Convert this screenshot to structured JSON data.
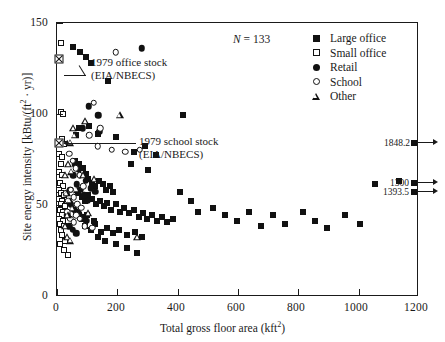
{
  "chart_data": {
    "type": "scatter",
    "title": "",
    "xlabel": "Total gross floor area (kft2)",
    "ylabel": "Site energy intensity [kBtu/(ft2 · yr)]",
    "xlim": [
      0,
      1200
    ],
    "ylim": [
      0,
      150
    ],
    "xticks": [
      0,
      200,
      400,
      600,
      800,
      1000,
      1200
    ],
    "yticks": [
      0,
      50,
      100,
      150
    ],
    "grid": false,
    "legend_position": "top-right",
    "sample_size_label": "N = 133",
    "sample_size": 133,
    "series": [
      {
        "name": "Large office",
        "marker": "filled-square",
        "points": [
          [
            52,
            137
          ],
          [
            78,
            134
          ],
          [
            96,
            131
          ],
          [
            112,
            128
          ],
          [
            420,
            99
          ],
          [
            170,
            118
          ],
          [
            72,
            92
          ],
          [
            108,
            93
          ],
          [
            136,
            89
          ],
          [
            196,
            87
          ],
          [
            62,
            88
          ],
          [
            258,
            79
          ],
          [
            292,
            82
          ],
          [
            330,
            77
          ],
          [
            248,
            72
          ],
          [
            302,
            69
          ],
          [
            60,
            74
          ],
          [
            74,
            72
          ],
          [
            86,
            70
          ],
          [
            96,
            67
          ],
          [
            104,
            64
          ],
          [
            116,
            62
          ],
          [
            126,
            60
          ],
          [
            140,
            63
          ],
          [
            152,
            61
          ],
          [
            164,
            58
          ],
          [
            176,
            60
          ],
          [
            188,
            57
          ],
          [
            70,
            56
          ],
          [
            82,
            54
          ],
          [
            92,
            52
          ],
          [
            104,
            55
          ],
          [
            118,
            53
          ],
          [
            130,
            50
          ],
          [
            142,
            52
          ],
          [
            156,
            49
          ],
          [
            168,
            51
          ],
          [
            180,
            47
          ],
          [
            196,
            50
          ],
          [
            210,
            46
          ],
          [
            224,
            48
          ],
          [
            240,
            45
          ],
          [
            256,
            47
          ],
          [
            272,
            43
          ],
          [
            286,
            45
          ],
          [
            300,
            42
          ],
          [
            318,
            44
          ],
          [
            334,
            41
          ],
          [
            350,
            43
          ],
          [
            368,
            40
          ],
          [
            386,
            42
          ],
          [
            94,
            38
          ],
          [
            112,
            36
          ],
          [
            128,
            39
          ],
          [
            148,
            35
          ],
          [
            166,
            37
          ],
          [
            186,
            34
          ],
          [
            208,
            36
          ],
          [
            232,
            33
          ],
          [
            260,
            35
          ],
          [
            284,
            32
          ],
          [
            64,
            46
          ],
          [
            74,
            44
          ],
          [
            84,
            42
          ],
          [
            100,
            44
          ],
          [
            122,
            41
          ],
          [
            410,
            57
          ],
          [
            448,
            52
          ],
          [
            470,
            46
          ],
          [
            520,
            48
          ],
          [
            560,
            44
          ],
          [
            600,
            41
          ],
          [
            640,
            46
          ],
          [
            680,
            38
          ],
          [
            720,
            44
          ],
          [
            760,
            39
          ],
          [
            820,
            46
          ],
          [
            860,
            41
          ],
          [
            900,
            37
          ],
          [
            960,
            44
          ],
          [
            1010,
            39
          ],
          [
            1060,
            61
          ],
          [
            1140,
            63
          ],
          [
            232,
            26
          ],
          [
            268,
            23
          ],
          [
            196,
            28
          ],
          [
            160,
            30
          ],
          [
            136,
            32
          ]
        ]
      },
      {
        "name": "Small office",
        "marker": "open-square",
        "points": [
          [
            14,
            139
          ],
          [
            12,
            101
          ],
          [
            20,
            100
          ],
          [
            16,
            86
          ],
          [
            10,
            84
          ],
          [
            22,
            83
          ],
          [
            8,
            78
          ],
          [
            18,
            76
          ],
          [
            12,
            72
          ],
          [
            6,
            68
          ],
          [
            16,
            66
          ],
          [
            10,
            62
          ],
          [
            20,
            60
          ],
          [
            8,
            58
          ],
          [
            14,
            56
          ],
          [
            24,
            55
          ],
          [
            6,
            53
          ],
          [
            18,
            52
          ],
          [
            12,
            50
          ],
          [
            26,
            49
          ],
          [
            9,
            47
          ],
          [
            21,
            46
          ],
          [
            15,
            44
          ],
          [
            7,
            42
          ],
          [
            19,
            41
          ],
          [
            11,
            39
          ],
          [
            23,
            38
          ],
          [
            13,
            36
          ],
          [
            17,
            33
          ],
          [
            28,
            30
          ],
          [
            10,
            28
          ],
          [
            22,
            25
          ],
          [
            36,
            22
          ]
        ]
      },
      {
        "name": "Retail",
        "marker": "filled-circle",
        "points": [
          [
            282,
            136
          ],
          [
            106,
            104
          ],
          [
            138,
            99
          ],
          [
            86,
            92
          ],
          [
            140,
            90
          ],
          [
            60,
            72
          ],
          [
            72,
            69
          ],
          [
            96,
            63
          ],
          [
            112,
            59
          ],
          [
            128,
            57
          ],
          [
            54,
            66
          ],
          [
            66,
            61
          ],
          [
            78,
            58
          ],
          [
            90,
            55
          ],
          [
            102,
            52
          ],
          [
            46,
            50
          ],
          [
            58,
            47
          ],
          [
            70,
            45
          ],
          [
            84,
            43
          ],
          [
            98,
            41
          ],
          [
            40,
            38
          ],
          [
            52,
            36
          ],
          [
            64,
            34
          ],
          [
            44,
            58
          ],
          [
            34,
            44
          ]
        ]
      },
      {
        "name": "School",
        "marker": "open-circle",
        "points": [
          [
            196,
            134
          ],
          [
            122,
            106
          ],
          [
            144,
            92
          ],
          [
            108,
            88
          ],
          [
            40,
            78
          ],
          [
            52,
            74
          ],
          [
            62,
            70
          ],
          [
            76,
            66
          ],
          [
            88,
            60
          ],
          [
            136,
            82
          ],
          [
            182,
            80
          ],
          [
            228,
            79
          ],
          [
            276,
            80
          ],
          [
            46,
            58
          ],
          [
            56,
            54
          ],
          [
            68,
            50
          ],
          [
            80,
            48
          ],
          [
            34,
            46
          ],
          [
            44,
            42
          ],
          [
            56,
            40
          ],
          [
            92,
            38
          ],
          [
            118,
            37
          ],
          [
            30,
            56
          ],
          [
            38,
            52
          ],
          [
            64,
            44
          ],
          [
            76,
            42
          ]
        ]
      },
      {
        "name": "Other",
        "marker": "open-triangle",
        "points": [
          [
            94,
            96
          ],
          [
            210,
            99
          ],
          [
            54,
            92
          ],
          [
            60,
            88
          ],
          [
            44,
            84
          ],
          [
            38,
            72
          ],
          [
            48,
            68
          ],
          [
            88,
            66
          ],
          [
            124,
            64
          ],
          [
            32,
            56
          ],
          [
            42,
            52
          ],
          [
            52,
            48
          ],
          [
            36,
            44
          ],
          [
            28,
            38
          ],
          [
            34,
            32
          ],
          [
            44,
            30
          ],
          [
            268,
            32
          ],
          [
            28,
            66
          ],
          [
            66,
            58
          ],
          [
            104,
            45
          ]
        ]
      }
    ],
    "annotations": [
      {
        "id": "office-stock",
        "lines": [
          "1979 office stock",
          "(EIA/NBECS)"
        ],
        "marker": "crossed-square",
        "x": 8,
        "y": 130
      },
      {
        "id": "school-stock",
        "lines": [
          "1979 school stock",
          "(EIA/NBECS)"
        ],
        "marker": "crossed-square",
        "x": 6,
        "y": 84
      }
    ],
    "offscale_points": [
      {
        "id": "offscale-upper",
        "labels": [
          "1848.2"
        ],
        "x": 1200,
        "y_display": 66,
        "values": [
          1848.2
        ]
      },
      {
        "id": "offscale-lower",
        "labels": [
          "1300",
          "1393.5"
        ],
        "x": 1200,
        "y_display": 42,
        "values": [
          1300,
          1393.5
        ]
      }
    ]
  },
  "axes": {
    "x_title_main": "Total gross floor area (kft",
    "x_title_sup": "2",
    "x_title_end": ")",
    "y_title_a": "Site energy intensity [kBtu/(ft",
    "y_title_sup": "2",
    "y_title_b": " · yr)]",
    "xticks": [
      "0",
      "200",
      "400",
      "600",
      "800",
      "1000",
      "1200"
    ],
    "yticks": [
      "0",
      "50",
      "100",
      "150"
    ]
  },
  "n_label": {
    "prefix": "N",
    "equals": " = ",
    "value": "133"
  },
  "legend": {
    "items": [
      {
        "label": "Large office",
        "marker": "filled-square"
      },
      {
        "label": "Small office",
        "marker": "open-square"
      },
      {
        "label": "Retail",
        "marker": "filled-circle"
      },
      {
        "label": "School",
        "marker": "open-circle"
      },
      {
        "label": "Other",
        "marker": "open-triangle"
      }
    ]
  },
  "annotations": {
    "office": {
      "line1": "1979 office stock",
      "line2": "(EIA/NBECS)"
    },
    "school": {
      "line1": "1979 school stock",
      "line2": "(EIA/NBECS)"
    }
  },
  "offscale": {
    "upper": "1848.2",
    "lower_a": "1300",
    "lower_b": "1393.5"
  },
  "colors": {
    "ink": "#1a1a1a",
    "background": "#ffffff"
  }
}
